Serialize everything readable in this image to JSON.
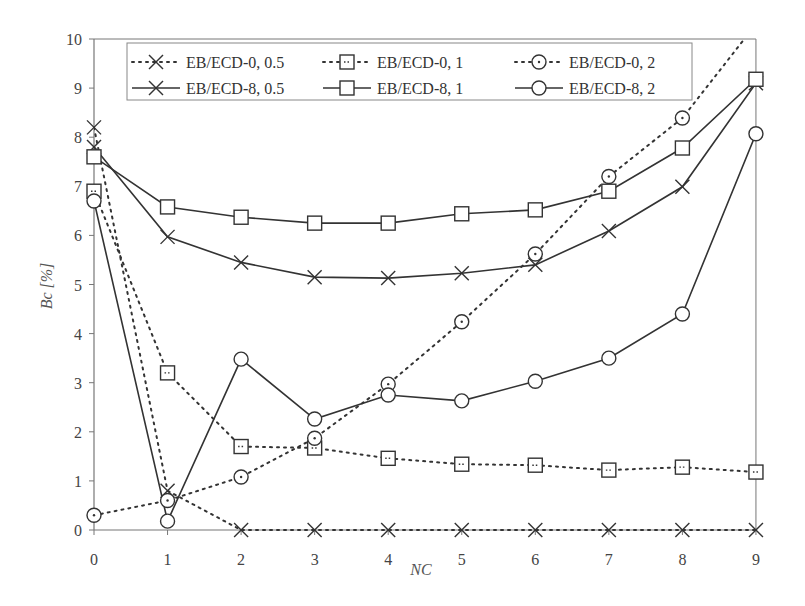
{
  "chart_data": {
    "type": "line",
    "title": "",
    "xlabel": "NC",
    "ylabel": "Bc [%]",
    "x": [
      0,
      1,
      2,
      3,
      4,
      5,
      6,
      7,
      8,
      9
    ],
    "xticks": [
      "0",
      "1",
      "2",
      "3",
      "4",
      "5",
      "6",
      "7",
      "8",
      "9"
    ],
    "yticks": [
      "0",
      "1",
      "2",
      "3",
      "4",
      "5",
      "6",
      "7",
      "8",
      "9",
      "10"
    ],
    "xlim": [
      0,
      9
    ],
    "ylim": [
      0,
      10
    ],
    "grid": false,
    "legend_position": "top, inside plot (2 rows x 3 columns)",
    "series": [
      {
        "name": "EB/ECD-0, 0.5",
        "marker": "x",
        "line": "dotted",
        "values": [
          8.2,
          0.8,
          0.0,
          0.0,
          0.0,
          0.0,
          0.0,
          0.0,
          0.0,
          0.0
        ]
      },
      {
        "name": "EB/ECD-0, 1",
        "marker": "square",
        "line": "dotted",
        "values": [
          6.9,
          3.2,
          1.7,
          1.67,
          1.46,
          1.34,
          1.32,
          1.22,
          1.28,
          1.18
        ]
      },
      {
        "name": "EB/ECD-0, 2",
        "marker": "circle",
        "line": "dotted",
        "values": [
          0.3,
          0.6,
          1.08,
          1.87,
          2.97,
          4.24,
          5.62,
          7.2,
          8.39,
          10.3
        ]
      },
      {
        "name": "EB/ECD-8, 0.5",
        "marker": "x",
        "line": "solid",
        "values": [
          7.8,
          5.97,
          5.45,
          5.15,
          5.13,
          5.23,
          5.4,
          6.09,
          6.99,
          9.1
        ]
      },
      {
        "name": "EB/ECD-8, 1",
        "marker": "square",
        "line": "solid",
        "values": [
          7.6,
          6.58,
          6.37,
          6.25,
          6.25,
          6.44,
          6.52,
          6.9,
          7.78,
          9.18
        ]
      },
      {
        "name": "EB/ECD-8, 2",
        "marker": "circle",
        "line": "solid",
        "values": [
          6.7,
          0.18,
          3.48,
          2.26,
          2.75,
          2.63,
          3.03,
          3.5,
          4.4,
          8.07
        ]
      }
    ]
  },
  "colors": {
    "line": "#333333",
    "axis": "#777777",
    "text": "#444444",
    "background": "#ffffff"
  }
}
